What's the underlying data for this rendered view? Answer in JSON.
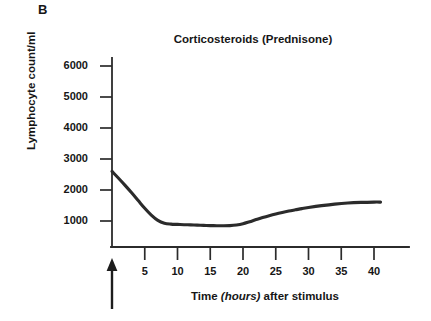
{
  "panel": {
    "label": "B"
  },
  "chart_data": {
    "type": "line",
    "title": "Corticosteroids (Prednisone)",
    "xlabel_prefix": "Time ",
    "xlabel_italic": "(hours)",
    "xlabel_suffix": " after stimulus",
    "xlabel": "Time (hours) after stimulus",
    "ylabel": "Lymphocyte count/ml",
    "xlim": [
      0,
      45
    ],
    "ylim": [
      0,
      6500
    ],
    "xticks": [
      5,
      10,
      15,
      20,
      25,
      30,
      35,
      40
    ],
    "xtick_labels": [
      "5",
      "10",
      "15",
      "20",
      "25",
      "30",
      "35",
      "40"
    ],
    "yticks": [
      1000,
      2000,
      3000,
      4000,
      5000,
      6000
    ],
    "ytick_labels": [
      "1000",
      "2000",
      "3000",
      "4000",
      "5000",
      "6000"
    ],
    "grid": false,
    "legend": null,
    "line_color": "#2b2b2b",
    "line_width": 3.1,
    "series": [
      {
        "name": "Lymphocyte count",
        "x": [
          0,
          1,
          2,
          3,
          4,
          5,
          6,
          7,
          8,
          9,
          10,
          11,
          12,
          13,
          14,
          15,
          16,
          17,
          18,
          19,
          20,
          21,
          22,
          23,
          24,
          25,
          26,
          27,
          28,
          29,
          30,
          32,
          34,
          36,
          38,
          40,
          41
        ],
        "values": [
          2600,
          2380,
          2150,
          1910,
          1660,
          1410,
          1190,
          1020,
          930,
          900,
          890,
          880,
          875,
          868,
          860,
          852,
          848,
          845,
          850,
          870,
          910,
          975,
          1045,
          1110,
          1170,
          1225,
          1275,
          1320,
          1360,
          1400,
          1435,
          1495,
          1545,
          1580,
          1600,
          1610,
          1610
        ]
      }
    ],
    "annotations": [
      {
        "name": "stimulus-arrow",
        "kind": "arrow-up",
        "at_x": 0,
        "description": "Upward arrow below axis origin marking the stimulus"
      }
    ]
  }
}
